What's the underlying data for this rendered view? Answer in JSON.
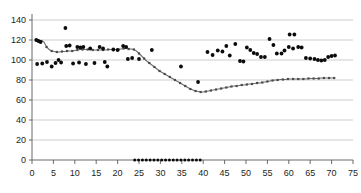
{
  "chart_data": {
    "type": "scatter",
    "title": "",
    "subtitle": "",
    "xlabel": "",
    "ylabel": "",
    "xlim": [
      0,
      75
    ],
    "ylim": [
      0,
      140
    ],
    "grid": true,
    "grid_axis": "y",
    "legend": false,
    "legend_position": "none",
    "x_ticks": [
      0,
      5,
      10,
      15,
      20,
      25,
      30,
      35,
      40,
      45,
      50,
      55,
      60,
      65,
      70,
      75
    ],
    "y_ticks": [
      0,
      20,
      40,
      60,
      80,
      100,
      120,
      140
    ],
    "x_tick_labels": [
      "0",
      "5",
      "10",
      "15",
      "20",
      "25",
      "30",
      "35",
      "40",
      "45",
      "50",
      "55",
      "60",
      "65",
      "70",
      "75"
    ],
    "y_tick_labels": [
      "0",
      "20",
      "40",
      "60",
      "80",
      "100",
      "120",
      "140"
    ],
    "series": [
      {
        "name": "trend-line-series",
        "style": "line-with-markers",
        "color": "#6e6e6e",
        "points": [
          [
            1.0,
            120.0
          ],
          [
            1.6,
            119.5
          ],
          [
            2.2,
            119.0
          ],
          [
            2.8,
            118.0
          ],
          [
            3.4,
            113.0
          ],
          [
            4.0,
            110.5
          ],
          [
            4.6,
            109.0
          ],
          [
            5.2,
            108.5
          ],
          [
            5.8,
            108.0
          ],
          [
            6.4,
            108.0
          ],
          [
            7.0,
            108.5
          ],
          [
            7.6,
            108.5
          ],
          [
            8.2,
            109.0
          ],
          [
            8.8,
            109.0
          ],
          [
            9.4,
            109.0
          ],
          [
            10.0,
            109.5
          ],
          [
            10.6,
            110.0
          ],
          [
            11.2,
            110.5
          ],
          [
            11.8,
            110.5
          ],
          [
            12.4,
            110.5
          ],
          [
            13.0,
            110.5
          ],
          [
            13.6,
            110.5
          ],
          [
            14.2,
            110.0
          ],
          [
            14.8,
            110.0
          ],
          [
            15.4,
            110.0
          ],
          [
            16.0,
            110.0
          ],
          [
            16.6,
            110.0
          ],
          [
            17.2,
            110.0
          ],
          [
            17.8,
            110.5
          ],
          [
            18.4,
            110.5
          ],
          [
            19.0,
            110.5
          ],
          [
            19.6,
            110.5
          ],
          [
            20.2,
            110.5
          ],
          [
            20.8,
            111.0
          ],
          [
            21.4,
            111.5
          ],
          [
            22.0,
            111.5
          ],
          [
            22.6,
            111.0
          ],
          [
            23.2,
            111.0
          ],
          [
            23.8,
            110.5
          ],
          [
            24.4,
            109.0
          ],
          [
            25.0,
            106.5
          ],
          [
            25.6,
            104.0
          ],
          [
            26.2,
            101.5
          ],
          [
            26.8,
            99.0
          ],
          [
            27.4,
            97.0
          ],
          [
            28.0,
            95.0
          ],
          [
            28.6,
            93.0
          ],
          [
            29.2,
            91.0
          ],
          [
            29.8,
            89.0
          ],
          [
            30.4,
            87.5
          ],
          [
            31.0,
            86.0
          ],
          [
            31.6,
            84.5
          ],
          [
            32.2,
            83.0
          ],
          [
            32.8,
            81.5
          ],
          [
            33.4,
            80.0
          ],
          [
            34.0,
            78.5
          ],
          [
            34.6,
            77.0
          ],
          [
            35.2,
            75.5
          ],
          [
            35.8,
            74.0
          ],
          [
            36.4,
            72.5
          ],
          [
            37.0,
            71.0
          ],
          [
            37.6,
            70.0
          ],
          [
            38.2,
            69.0
          ],
          [
            38.8,
            68.5
          ],
          [
            39.4,
            68.0
          ],
          [
            40.0,
            68.0
          ],
          [
            40.6,
            68.5
          ],
          [
            41.2,
            69.0
          ],
          [
            41.8,
            69.5
          ],
          [
            42.4,
            70.0
          ],
          [
            43.0,
            70.5
          ],
          [
            43.6,
            71.0
          ],
          [
            44.2,
            71.5
          ],
          [
            44.8,
            72.0
          ],
          [
            45.4,
            72.5
          ],
          [
            46.0,
            73.0
          ],
          [
            46.6,
            73.5
          ],
          [
            47.2,
            74.0
          ],
          [
            47.8,
            74.0
          ],
          [
            48.4,
            74.5
          ],
          [
            49.0,
            75.0
          ],
          [
            49.6,
            75.0
          ],
          [
            50.2,
            75.5
          ],
          [
            50.8,
            76.0
          ],
          [
            51.4,
            76.0
          ],
          [
            52.0,
            76.5
          ],
          [
            52.6,
            77.0
          ],
          [
            53.2,
            77.0
          ],
          [
            53.8,
            77.5
          ],
          [
            54.4,
            78.0
          ],
          [
            55.0,
            78.5
          ],
          [
            55.6,
            79.0
          ],
          [
            56.2,
            79.5
          ],
          [
            56.8,
            80.0
          ],
          [
            57.4,
            80.0
          ],
          [
            58.0,
            80.5
          ],
          [
            58.6,
            80.5
          ],
          [
            59.2,
            80.5
          ],
          [
            59.8,
            81.0
          ],
          [
            60.4,
            81.0
          ],
          [
            61.0,
            81.0
          ],
          [
            61.6,
            81.0
          ],
          [
            62.2,
            81.0
          ],
          [
            62.8,
            81.0
          ],
          [
            63.4,
            81.0
          ],
          [
            64.0,
            81.0
          ],
          [
            64.6,
            81.5
          ],
          [
            65.2,
            81.5
          ],
          [
            65.8,
            81.5
          ],
          [
            66.4,
            81.5
          ],
          [
            67.0,
            81.5
          ],
          [
            67.6,
            82.0
          ],
          [
            68.2,
            82.0
          ],
          [
            68.8,
            82.0
          ],
          [
            69.4,
            82.0
          ],
          [
            70.0,
            82.0
          ],
          [
            70.6,
            82.0
          ]
        ]
      },
      {
        "name": "observation-scatter",
        "style": "markers",
        "color": "#0b0b0b",
        "points": [
          [
            1.0,
            120.0
          ],
          [
            1.5,
            119.0
          ],
          [
            2.0,
            118.0
          ],
          [
            1.2,
            96.0
          ],
          [
            2.4,
            96.5
          ],
          [
            3.5,
            98.0
          ],
          [
            4.6,
            93.5
          ],
          [
            5.5,
            97.0
          ],
          [
            6.2,
            100.0
          ],
          [
            6.8,
            97.5
          ],
          [
            7.8,
            132.0
          ],
          [
            8.0,
            114.0
          ],
          [
            8.8,
            114.5
          ],
          [
            9.6,
            96.5
          ],
          [
            10.6,
            113.0
          ],
          [
            11.3,
            112.5
          ],
          [
            12.0,
            113.0
          ],
          [
            11.0,
            97.5
          ],
          [
            12.6,
            96.0
          ],
          [
            13.6,
            111.5
          ],
          [
            14.6,
            97.0
          ],
          [
            15.8,
            113.0
          ],
          [
            16.6,
            111.5
          ],
          [
            17.0,
            98.0
          ],
          [
            17.6,
            93.5
          ],
          [
            19.0,
            110.5
          ],
          [
            20.0,
            110.0
          ],
          [
            21.3,
            114.0
          ],
          [
            22.0,
            113.0
          ],
          [
            22.4,
            101.0
          ],
          [
            23.4,
            102.0
          ],
          [
            25.0,
            101.0
          ],
          [
            28.0,
            110.0
          ],
          [
            34.8,
            93.5
          ],
          [
            38.8,
            78.0
          ],
          [
            41.0,
            108.0
          ],
          [
            42.2,
            105.0
          ],
          [
            43.4,
            109.5
          ],
          [
            44.5,
            108.5
          ],
          [
            45.4,
            114.0
          ],
          [
            46.2,
            104.5
          ],
          [
            47.5,
            116.0
          ],
          [
            48.6,
            99.0
          ],
          [
            49.4,
            98.5
          ],
          [
            50.2,
            112.5
          ],
          [
            51.0,
            110.0
          ],
          [
            51.8,
            107.0
          ],
          [
            52.6,
            106.0
          ],
          [
            53.5,
            103.0
          ],
          [
            54.4,
            103.0
          ],
          [
            55.5,
            121.0
          ],
          [
            56.4,
            115.0
          ],
          [
            57.2,
            106.5
          ],
          [
            58.3,
            106.5
          ],
          [
            59.0,
            109.5
          ],
          [
            60.2,
            125.5
          ],
          [
            61.3,
            125.5
          ],
          [
            60.0,
            113.0
          ],
          [
            61.0,
            111.5
          ],
          [
            62.2,
            113.0
          ],
          [
            63.0,
            112.5
          ],
          [
            64.0,
            102.0
          ],
          [
            65.0,
            101.5
          ],
          [
            66.0,
            101.0
          ],
          [
            66.8,
            100.0
          ],
          [
            67.6,
            99.5
          ],
          [
            68.4,
            100.0
          ],
          [
            69.2,
            103.0
          ],
          [
            70.0,
            104.0
          ],
          [
            70.8,
            104.5
          ]
        ]
      },
      {
        "name": "baseline-zero-series",
        "style": "markers",
        "color": "#0b0b0b",
        "points": [
          [
            24.0,
            0
          ],
          [
            24.9,
            0
          ],
          [
            25.8,
            0
          ],
          [
            26.7,
            0
          ],
          [
            27.6,
            0
          ],
          [
            28.5,
            0
          ],
          [
            29.4,
            0
          ],
          [
            30.3,
            0
          ],
          [
            31.2,
            0
          ],
          [
            32.1,
            0
          ],
          [
            33.0,
            0
          ],
          [
            33.9,
            0
          ],
          [
            34.8,
            0
          ],
          [
            35.7,
            0
          ],
          [
            36.6,
            0
          ],
          [
            37.5,
            0
          ],
          [
            38.4,
            0
          ],
          [
            39.3,
            0
          ]
        ]
      }
    ]
  },
  "plot_geometry": {
    "left": 32,
    "right": 353,
    "top": 20,
    "bottom": 160
  },
  "colors": {
    "grid": "#b9b9b9",
    "axis": "#5a5a5a",
    "scatter": "#0b0b0b",
    "line": "#6e6e6e",
    "background": "#ffffff"
  }
}
